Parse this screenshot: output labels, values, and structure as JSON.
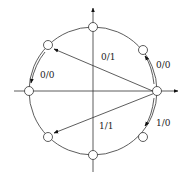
{
  "diagram": {
    "type": "circle-state-transition",
    "center": [
      93,
      91
    ],
    "radius": 64,
    "nodes": [
      {
        "id": "n0",
        "angle_deg": 0
      },
      {
        "id": "n45",
        "angle_deg": 45
      },
      {
        "id": "n90",
        "angle_deg": 90
      },
      {
        "id": "n135",
        "angle_deg": 135
      },
      {
        "id": "n180",
        "angle_deg": 180
      },
      {
        "id": "n225",
        "angle_deg": 225
      },
      {
        "id": "n270",
        "angle_deg": 270
      },
      {
        "id": "n315",
        "angle_deg": 315
      }
    ],
    "edges": [
      {
        "from": "n0",
        "to": "n45",
        "label": "0/0"
      },
      {
        "from": "n0",
        "to": "n135",
        "label": "0/1"
      },
      {
        "from": "n135",
        "to": "n180",
        "label": "0/0"
      },
      {
        "from": "n0",
        "to": "n315",
        "label": "1/0"
      },
      {
        "from": "n0",
        "to": "n225",
        "label": "1/1"
      }
    ],
    "labels": {
      "l_0_1": "0/1",
      "l_0_0_right": "0/0",
      "l_0_0_left": "0/0",
      "l_1_0": "1/0",
      "l_1_1": "1/1"
    }
  }
}
